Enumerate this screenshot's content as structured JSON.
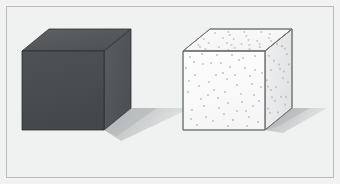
{
  "figure": {
    "title": "Two cubes on a light background",
    "width": 340,
    "height": 184,
    "background_color": "#f2f2f2",
    "plate_color": "#f0f1f1",
    "frame_border_color": "#b9bcbd",
    "frame_inset_px": 6
  },
  "objects": [
    {
      "id": "dark-cube",
      "label": "Dark solid cube",
      "material": "opaque dark gray",
      "front_face_color": "#4a4c4f",
      "right_face_color": "#55585b",
      "top_face_color": "#55585b",
      "edge_color": "#2e3032",
      "speckled": false,
      "geometry": {
        "front": [
          [
            21,
            50
          ],
          [
            103,
            50
          ],
          [
            103,
            129
          ],
          [
            21,
            129
          ]
        ],
        "top": [
          [
            21,
            50
          ],
          [
            48,
            28
          ],
          [
            130,
            28
          ],
          [
            103,
            50
          ]
        ],
        "right": [
          [
            103,
            50
          ],
          [
            130,
            28
          ],
          [
            130,
            107
          ],
          [
            103,
            129
          ]
        ]
      },
      "shadow": {
        "color_near": "#b9bcbe",
        "color_far": "#d8dadb",
        "points": [
          [
            103,
            129
          ],
          [
            130,
            107
          ],
          [
            190,
            107
          ],
          [
            120,
            140
          ]
        ]
      }
    },
    {
      "id": "speckled-cube",
      "label": "Light speckled cube",
      "material": "white with gray speckles",
      "front_face_color": "#fbfbfb",
      "right_face_color": "#ededee",
      "top_face_color": "#f7f7f8",
      "edge_color": "#6c7073",
      "speckled": true,
      "speckle_color": "#b6bcbf",
      "speckle_radius_px": 1.1,
      "geometry": {
        "front": [
          [
            182,
            50
          ],
          [
            264,
            50
          ],
          [
            264,
            129
          ],
          [
            182,
            129
          ]
        ],
        "top": [
          [
            182,
            50
          ],
          [
            209,
            28
          ],
          [
            291,
            28
          ],
          [
            264,
            50
          ]
        ],
        "right": [
          [
            264,
            50
          ],
          [
            291,
            28
          ],
          [
            291,
            107
          ],
          [
            264,
            129
          ]
        ]
      },
      "shadow": {
        "color_near": "#b9bcbe",
        "color_far": "#d8dadb",
        "points": [
          [
            264,
            129
          ],
          [
            291,
            107
          ],
          [
            324,
            107
          ],
          [
            281,
            129
          ]
        ]
      }
    }
  ],
  "speckle_points": {
    "front": [
      [
        7,
        6
      ],
      [
        20,
        13
      ],
      [
        34,
        4
      ],
      [
        47,
        16
      ],
      [
        60,
        7
      ],
      [
        72,
        19
      ],
      [
        12,
        24
      ],
      [
        26,
        31
      ],
      [
        40,
        22
      ],
      [
        54,
        34
      ],
      [
        67,
        25
      ],
      [
        78,
        36
      ],
      [
        5,
        41
      ],
      [
        18,
        48
      ],
      [
        31,
        39
      ],
      [
        45,
        52
      ],
      [
        58,
        43
      ],
      [
        70,
        55
      ],
      [
        9,
        59
      ],
      [
        23,
        66
      ],
      [
        36,
        57
      ],
      [
        50,
        69
      ],
      [
        63,
        60
      ],
      [
        75,
        71
      ],
      [
        14,
        74
      ],
      [
        28,
        12
      ],
      [
        41,
        63
      ],
      [
        56,
        9
      ],
      [
        69,
        33
      ],
      [
        3,
        17
      ],
      [
        16,
        35
      ],
      [
        30,
        70
      ],
      [
        44,
        28
      ],
      [
        62,
        17
      ],
      [
        76,
        50
      ],
      [
        21,
        55
      ],
      [
        35,
        47
      ],
      [
        49,
        4
      ],
      [
        64,
        75
      ],
      [
        8,
        68
      ],
      [
        52,
        24
      ],
      [
        38,
        12
      ],
      [
        72,
        5
      ],
      [
        25,
        44
      ],
      [
        59,
        51
      ],
      [
        11,
        11
      ],
      [
        45,
        75
      ],
      [
        33,
        24
      ],
      [
        66,
        66
      ],
      [
        19,
        3
      ],
      [
        54,
        60
      ],
      [
        79,
        22
      ],
      [
        6,
        30
      ],
      [
        42,
        41
      ],
      [
        71,
        44
      ]
    ],
    "top": [
      [
        10,
        4
      ],
      [
        24,
        9
      ],
      [
        38,
        3
      ],
      [
        52,
        11
      ],
      [
        66,
        5
      ],
      [
        76,
        12
      ],
      [
        16,
        14
      ],
      [
        31,
        18
      ],
      [
        45,
        7
      ],
      [
        59,
        16
      ],
      [
        70,
        9
      ],
      [
        6,
        10
      ],
      [
        20,
        20
      ],
      [
        34,
        14
      ],
      [
        48,
        19
      ],
      [
        62,
        12
      ],
      [
        72,
        18
      ],
      [
        27,
        6
      ],
      [
        41,
        16
      ],
      [
        55,
        3
      ],
      [
        12,
        18
      ],
      [
        64,
        20
      ],
      [
        36,
        10
      ],
      [
        50,
        15
      ],
      [
        22,
        3
      ],
      [
        68,
        15
      ],
      [
        8,
        16
      ],
      [
        44,
        21
      ]
    ],
    "right": [
      [
        4,
        8
      ],
      [
        12,
        3
      ],
      [
        20,
        14
      ],
      [
        6,
        24
      ],
      [
        15,
        30
      ],
      [
        22,
        21
      ],
      [
        3,
        38
      ],
      [
        11,
        45
      ],
      [
        19,
        36
      ],
      [
        7,
        52
      ],
      [
        16,
        59
      ],
      [
        23,
        50
      ],
      [
        5,
        66
      ],
      [
        13,
        72
      ],
      [
        21,
        63
      ],
      [
        9,
        17
      ],
      [
        18,
        42
      ],
      [
        2,
        31
      ],
      [
        24,
        33
      ],
      [
        10,
        58
      ],
      [
        17,
        9
      ],
      [
        6,
        44
      ],
      [
        20,
        70
      ],
      [
        14,
        25
      ],
      [
        3,
        60
      ]
    ]
  },
  "annotations": {
    "left_object_description": "Dark gray opaque cube casting a soft shadow to the lower right",
    "right_object_description": "Light speckled cube of the same size casting a matching shadow"
  }
}
